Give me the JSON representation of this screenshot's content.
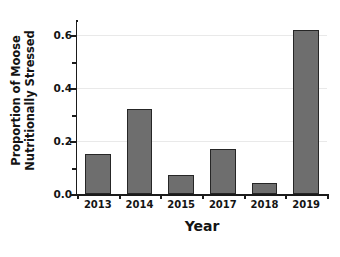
{
  "chart_data": {
    "type": "bar",
    "title": "",
    "subtitle": "",
    "xlabel": "Year",
    "ylabel_line1": "Proportion of Moose",
    "ylabel_line2": "Nutritionally Stressed",
    "ylabel": "Proportion of Moose Nutritionally Stressed",
    "categories": [
      "2013",
      "2014",
      "2015",
      "2017",
      "2018",
      "2019"
    ],
    "values": [
      0.15,
      0.32,
      0.07,
      0.17,
      0.04,
      0.62
    ],
    "ylim": [
      0,
      0.65
    ],
    "ytick_values": [
      0.0,
      0.2,
      0.4,
      0.6
    ],
    "ytick_labels": [
      "0.0",
      "0.2",
      "0.4",
      "0.6"
    ],
    "yminor_ticks": [
      0.1,
      0.3,
      0.5
    ],
    "grid": true,
    "grid_axis": "y",
    "legend": false,
    "legend_position": "none",
    "bar_color": "#6e6e6e",
    "bar_edge_color": "#262626",
    "grid_color": "#e9e9e9",
    "axis_color": "#1b1b1b",
    "background_color": "#ffffff"
  }
}
